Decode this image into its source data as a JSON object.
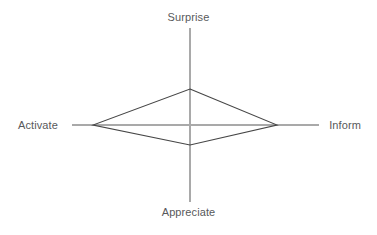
{
  "chart_data": {
    "type": "radar",
    "title": "",
    "subtitle": "",
    "xlabel": "",
    "ylabel": "",
    "grid": false,
    "legend": null,
    "axes": [
      {
        "label": "Surprise",
        "direction": "up",
        "value": 0.37
      },
      {
        "label": "Inform",
        "direction": "right",
        "value": 0.67
      },
      {
        "label": "Appreciate",
        "direction": "down",
        "value": 0.26
      },
      {
        "label": "Activate",
        "direction": "left",
        "value": 1.0
      }
    ],
    "categories": [
      "Surprise",
      "Inform",
      "Appreciate",
      "Activate"
    ],
    "values": [
      0.37,
      0.67,
      0.26,
      1.0
    ],
    "range": [
      0,
      1
    ],
    "series": [
      {
        "name": "",
        "values": [
          0.37,
          0.67,
          0.26,
          1.0
        ]
      }
    ],
    "geometry": {
      "center_x": 190,
      "center_y": 125,
      "axis_up_end_y": 28,
      "axis_down_end_y": 202,
      "axis_left_end_x": 72,
      "axis_right_end_x": 319,
      "vertex_top": {
        "x": 190,
        "y": 89
      },
      "vertex_right": {
        "x": 277,
        "y": 125
      },
      "vertex_bottom": {
        "x": 190,
        "y": 145
      },
      "vertex_left": {
        "x": 93,
        "y": 125
      }
    },
    "colors": {
      "background": "#ffffff",
      "axis_line": "#a9a9a9",
      "series_line": "#464646",
      "label_text": "#58595b"
    }
  },
  "labels": {
    "top": "Surprise",
    "right": "Inform",
    "bottom": "Appreciate",
    "left": "Activate"
  }
}
